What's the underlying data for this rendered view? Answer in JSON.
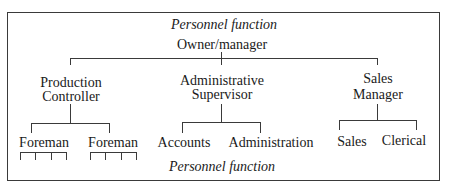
{
  "diagram": {
    "type": "organization-chart",
    "header_caption": "Personnel function",
    "footer_caption": "Personnel function",
    "root": {
      "label": "Owner/manager",
      "children": [
        {
          "label_line1": "Production",
          "label_line2": "Controller",
          "children": [
            {
              "label": "Foreman",
              "subordinate_count": 4
            },
            {
              "label": "Foreman",
              "subordinate_count": 4
            }
          ]
        },
        {
          "label_line1": "Administrative",
          "label_line2": "Supervisor",
          "children": [
            {
              "label": "Accounts"
            },
            {
              "label": "Administration"
            }
          ]
        },
        {
          "label_line1": "Sales",
          "label_line2": "Manager",
          "children": [
            {
              "label": "Sales"
            },
            {
              "label": "Clerical"
            }
          ]
        }
      ]
    }
  }
}
